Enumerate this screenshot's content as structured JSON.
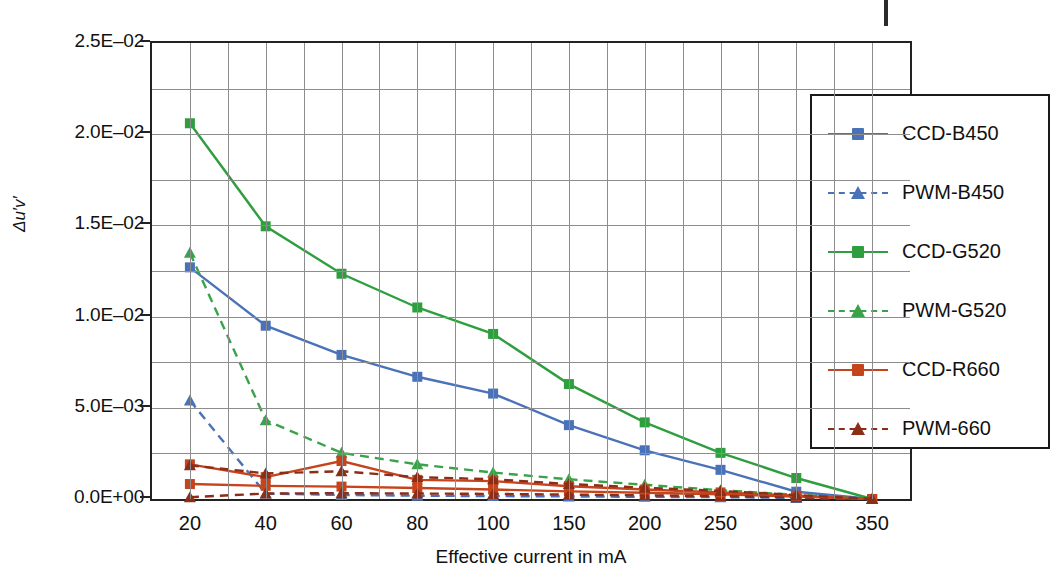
{
  "chart_data": {
    "type": "line",
    "title": "",
    "xlabel": "Effective current in mA",
    "ylabel": "Δu′v′",
    "categories": [
      "20",
      "40",
      "60",
      "80",
      "100",
      "150",
      "200",
      "250",
      "300",
      "350"
    ],
    "ylim": [
      0,
      0.025
    ],
    "ytick_labels": [
      "0.0E+00",
      "5.0E–03",
      "1.0E–02",
      "1.5E–02",
      "2.0E–02",
      "2.5E–02"
    ],
    "ytick_values": [
      0,
      0.005,
      0.01,
      0.015,
      0.02,
      0.025
    ],
    "grid": true,
    "minor_grid": true,
    "legend_position": "top-right",
    "series": [
      {
        "name": "CCD-B450",
        "color": "#4a72b8",
        "style": "solid",
        "marker": "square",
        "values": [
          0.0127,
          0.0095,
          0.0079,
          0.0067,
          0.00578,
          0.00405,
          0.00267,
          0.0016,
          0.0004,
          0.0
        ]
      },
      {
        "name": "PWM-B450",
        "color": "#4a72b8",
        "style": "dashed",
        "marker": "triangle",
        "values": [
          0.0054,
          0.0003,
          0.00022,
          0.00018,
          0.00016,
          0.00014,
          0.00012,
          0.0001,
          6e-05,
          0.0
        ]
      },
      {
        "name": "CCD-G520",
        "color": "#2f9e3f",
        "style": "solid",
        "marker": "square",
        "values": [
          0.0206,
          0.01495,
          0.01235,
          0.0105,
          0.00905,
          0.0063,
          0.0042,
          0.00253,
          0.00115,
          0.0
        ]
      },
      {
        "name": "PWM-G520",
        "color": "#3aa34a",
        "style": "dashed",
        "marker": "triangle",
        "values": [
          0.0135,
          0.00432,
          0.00253,
          0.0019,
          0.00145,
          0.00108,
          0.00078,
          0.00048,
          0.00023,
          0.0
        ]
      },
      {
        "name": "CCD-R660",
        "color": "#c6441c",
        "style": "solid",
        "marker": "square",
        "values": [
          0.00082,
          0.00072,
          0.00068,
          0.0006,
          0.00052,
          0.00042,
          0.00034,
          0.00026,
          0.00014,
          0.0
        ]
      },
      {
        "name": "PWM-660",
        "color": "#8c2d18",
        "style": "dashed",
        "marker": "triangle",
        "values": [
          0.0001,
          0.0003,
          0.00032,
          0.0003,
          0.00028,
          0.00024,
          0.0002,
          0.00016,
          9e-05,
          0.0
        ]
      },
      {
        "name": "CCD-R660-hi",
        "color": "#c6441c",
        "style": "solid",
        "marker": "square",
        "values": [
          0.0019,
          0.0012,
          0.00208,
          0.00105,
          0.00098,
          0.0007,
          0.00052,
          0.00036,
          0.00018,
          0.0
        ]
      },
      {
        "name": "PWM-660-hi",
        "color": "#8c2d18",
        "style": "dashed",
        "marker": "triangle",
        "values": [
          0.00185,
          0.0014,
          0.00152,
          0.0012,
          0.00108,
          0.00082,
          0.00062,
          0.00044,
          0.00022,
          0.0
        ]
      }
    ],
    "legend_entries": [
      {
        "label": "CCD-B450",
        "color": "#4a72b8",
        "style": "solid",
        "marker": "square"
      },
      {
        "label": "PWM-B450",
        "color": "#4a72b8",
        "style": "dashed",
        "marker": "triangle"
      },
      {
        "label": "CCD-G520",
        "color": "#2f9e3f",
        "style": "solid",
        "marker": "square"
      },
      {
        "label": "PWM-G520",
        "color": "#3aa34a",
        "style": "dashed",
        "marker": "triangle"
      },
      {
        "label": "CCD-R660",
        "color": "#c6441c",
        "style": "solid",
        "marker": "square"
      },
      {
        "label": "PWM-660",
        "color": "#8c2d18",
        "style": "dashed",
        "marker": "triangle"
      }
    ]
  },
  "axis": {
    "x_title": "Effective current in mA",
    "y_title_delta": "Δ",
    "y_title_rest": "u′v′"
  }
}
